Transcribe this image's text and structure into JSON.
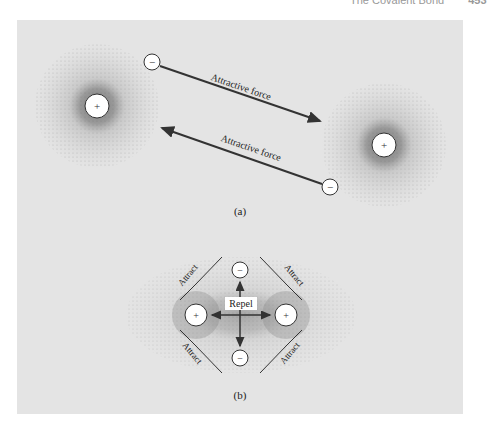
{
  "header": {
    "title": "The Covalent Bond",
    "page_number": "453"
  },
  "colors": {
    "panel_background": "#e4e4e4",
    "ink": "#333333",
    "nucleus_fill": "#ffffff",
    "cloud_dot": "#6a6a6a"
  },
  "part_a": {
    "caption": "(a)",
    "nucleus_symbol": "+",
    "electron_symbol": "−",
    "arrow_top_label": "Attractive force",
    "arrow_bottom_label": "Attractive force"
  },
  "part_b": {
    "caption": "(b)",
    "nucleus_symbol": "+",
    "electron_symbol": "−",
    "repel_label": "Repel",
    "attract_labels": [
      "Attract",
      "Attract",
      "Attract",
      "Attract"
    ]
  }
}
